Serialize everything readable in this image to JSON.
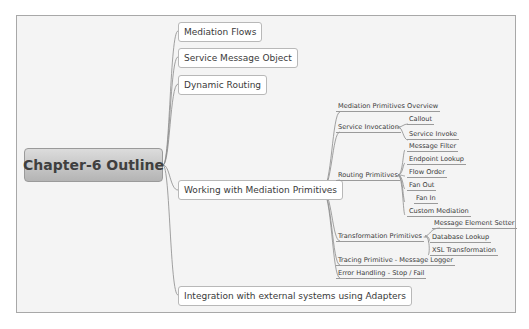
{
  "mindmap": {
    "root": "Chapter-6 Outline",
    "branches": [
      {
        "label": "Mediation Flows"
      },
      {
        "label": "Service Message Object"
      },
      {
        "label": "Dynamic Routing"
      },
      {
        "label": "Working with Mediation Primitives",
        "children": [
          {
            "label": "Mediation  Primitives Overview"
          },
          {
            "label": "Service Invocation",
            "children": [
              {
                "label": "Callout"
              },
              {
                "label": "Service Invoke"
              }
            ]
          },
          {
            "label": "Routing Primitives",
            "children": [
              {
                "label": "Message Filter"
              },
              {
                "label": "Endpoint Lookup"
              },
              {
                "label": "Flow Order"
              },
              {
                "label": "Fan Out"
              },
              {
                "label": "Fan In"
              },
              {
                "label": "Custom Mediation"
              }
            ]
          },
          {
            "label": "Transformation Primitives",
            "children": [
              {
                "label": "Message Element Setter"
              },
              {
                "label": "Database Lookup"
              },
              {
                "label": "XSL Transformation"
              }
            ]
          },
          {
            "label": "Tracing Primitive - Message Logger"
          },
          {
            "label": "Error Handling - Stop / Fail"
          }
        ]
      },
      {
        "label": "Integration with external systems using Adapters"
      }
    ],
    "collapse_icon": "="
  }
}
